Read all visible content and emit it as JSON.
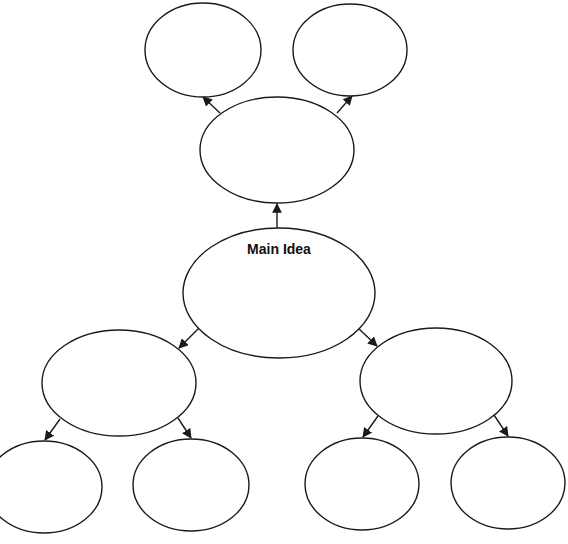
{
  "diagram": {
    "type": "concept-map",
    "stroke_color": "#1a1a1a",
    "background": "#ffffff",
    "main_idea": {
      "label": "Main Idea",
      "cx": 279,
      "cy": 293,
      "rx": 96,
      "ry": 65
    },
    "nodes": [
      {
        "id": "top-left",
        "label": "",
        "cx": 203,
        "cy": 50,
        "rx": 58,
        "ry": 47
      },
      {
        "id": "top-right",
        "label": "",
        "cx": 350,
        "cy": 50,
        "rx": 57,
        "ry": 46
      },
      {
        "id": "upper-middle",
        "label": "",
        "cx": 277,
        "cy": 150,
        "rx": 77,
        "ry": 53
      },
      {
        "id": "left-middle",
        "label": "",
        "cx": 119,
        "cy": 383,
        "rx": 77,
        "ry": 53
      },
      {
        "id": "right-middle",
        "label": "",
        "cx": 436,
        "cy": 381,
        "rx": 76,
        "ry": 53
      },
      {
        "id": "bottom-1",
        "label": "",
        "cx": 44,
        "cy": 487,
        "rx": 58,
        "ry": 46
      },
      {
        "id": "bottom-2",
        "label": "",
        "cx": 191,
        "cy": 485,
        "rx": 58,
        "ry": 46
      },
      {
        "id": "bottom-3",
        "label": "",
        "cx": 362,
        "cy": 484,
        "rx": 57,
        "ry": 46
      },
      {
        "id": "bottom-4",
        "label": "",
        "cx": 508,
        "cy": 483,
        "rx": 57,
        "ry": 46
      }
    ],
    "edges": [
      {
        "from": "main-idea",
        "to": "upper-middle"
      },
      {
        "from": "upper-middle",
        "to": "top-left"
      },
      {
        "from": "upper-middle",
        "to": "top-right"
      },
      {
        "from": "main-idea",
        "to": "left-middle"
      },
      {
        "from": "main-idea",
        "to": "right-middle"
      },
      {
        "from": "left-middle",
        "to": "bottom-1"
      },
      {
        "from": "left-middle",
        "to": "bottom-2"
      },
      {
        "from": "right-middle",
        "to": "bottom-3"
      },
      {
        "from": "right-middle",
        "to": "bottom-4"
      }
    ]
  }
}
